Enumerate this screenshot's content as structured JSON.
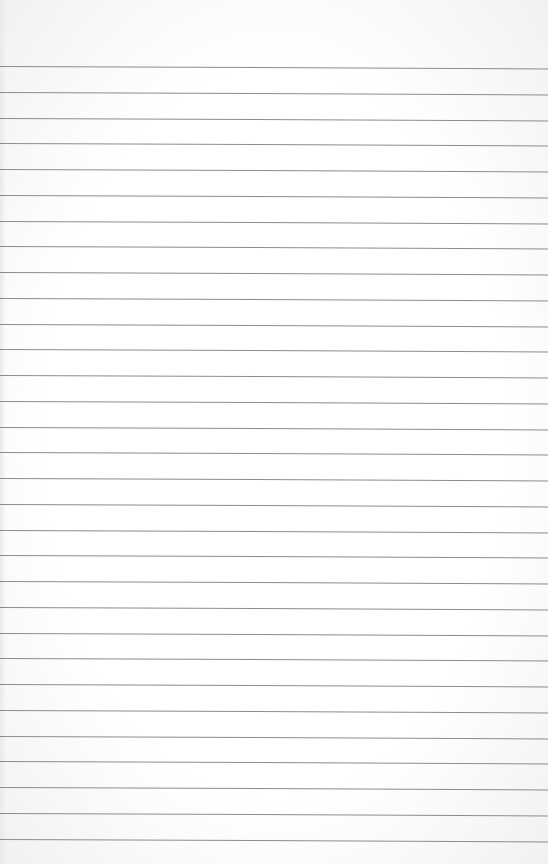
{
  "paper": {
    "type": "lined-paper",
    "background_color": "#ffffff",
    "line_color": "#8c8c8c",
    "first_line_y": 66,
    "line_spacing": 25.75,
    "line_count": 31
  }
}
